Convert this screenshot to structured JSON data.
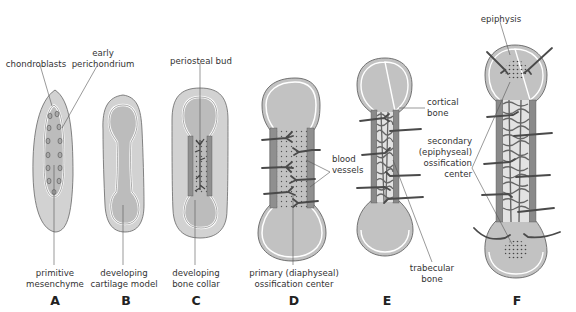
{
  "diagram": {
    "colors": {
      "background": "#ffffff",
      "mesenchyme_outer": "#d4d4d4",
      "cartilage": "#bdbdbd",
      "perichondrium_line": "#ffffff",
      "outline": "#555555",
      "bone_collar": "#9a9a9a",
      "vessel": "#4d4d4d",
      "trabecular_fill": "#e6e6e6",
      "text": "#333333"
    },
    "panels": [
      {
        "id": "A",
        "letter": "A",
        "labels": {
          "top_left": "chondroblasts",
          "top_right_line1": "early",
          "top_right_line2": "perichondrium",
          "bottom_line1": "primitive",
          "bottom_line2": "mesenchyme"
        }
      },
      {
        "id": "B",
        "letter": "B",
        "labels": {
          "bottom_line1": "developing",
          "bottom_line2": "cartilage model"
        }
      },
      {
        "id": "C",
        "letter": "C",
        "labels": {
          "top": "periosteal bud",
          "bottom_line1": "developing",
          "bottom_line2": "bone collar"
        }
      },
      {
        "id": "D",
        "letter": "D",
        "labels": {
          "right_line1": "blood",
          "right_line2": "vessels",
          "bottom_line1": "primary (diaphyseal)",
          "bottom_line2": "ossification center"
        }
      },
      {
        "id": "E",
        "letter": "E",
        "labels": {
          "right_line1": "cortical",
          "right_line2": "bone",
          "bottom_line1": "trabecular",
          "bottom_line2": "bone"
        }
      },
      {
        "id": "F",
        "letter": "F",
        "labels": {
          "top": "epiphysis",
          "left_line1": "secondary",
          "left_line2": "(epiphyseal)",
          "left_line3": "ossification",
          "left_line4": "center"
        }
      }
    ]
  }
}
